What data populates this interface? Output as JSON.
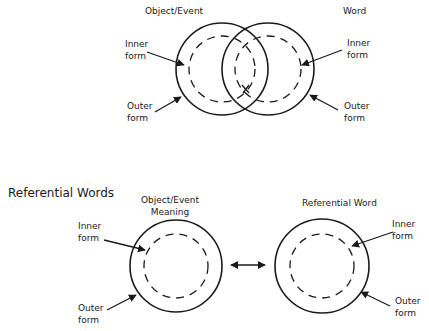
{
  "diagram_top": {
    "left_title": "Object/Event",
    "right_title": "Word",
    "left_inner": [
      "Inner",
      "form"
    ],
    "left_outer": [
      "Outer",
      "form"
    ],
    "right_inner": [
      "Inner",
      "form"
    ],
    "right_outer": [
      "Outer",
      "form"
    ],
    "intersection_mark": "x"
  },
  "diagram_bottom": {
    "section_title": "Referential Words",
    "left_title": [
      "Object/Event",
      "Meaning"
    ],
    "right_title": "Referential Word",
    "left_inner": [
      "Inner",
      "form"
    ],
    "left_outer": [
      "Outer",
      "form"
    ],
    "right_inner": [
      "Inner",
      "form"
    ],
    "right_outer": [
      "Outer",
      "form"
    ],
    "connector": "double-arrow"
  },
  "colors": {
    "stroke": "#1a1a1a",
    "background": "#ffffff"
  }
}
